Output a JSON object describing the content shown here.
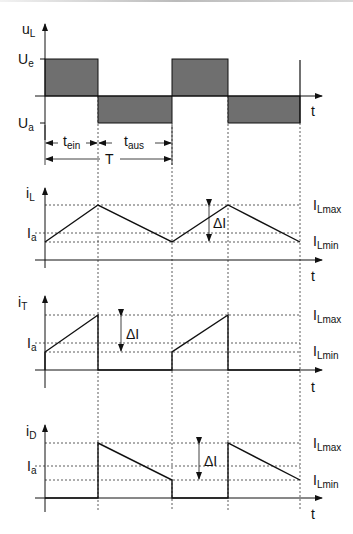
{
  "figure": {
    "colors": {
      "fill_area": "#6f6f6f",
      "line": "#111111",
      "dashed": "#333333",
      "background": "#ffffff"
    }
  },
  "plots": {
    "uL": {
      "axis_label_main": "u",
      "axis_label_sub": "L",
      "level_high_main": "U",
      "level_high_sub": "e",
      "level_low_main": "U",
      "level_low_sub": "a",
      "x_label": "t"
    },
    "timing": {
      "ton_main": "t",
      "ton_sub": "ein",
      "toff_main": "t",
      "toff_sub": "aus",
      "period": "T"
    },
    "iL": {
      "axis_label_main": "i",
      "axis_label_sub": "L",
      "avg_main": "I",
      "avg_sub": "a",
      "max_main": "I",
      "max_sub": "Lmax",
      "min_main": "I",
      "min_sub": "Lmin",
      "delta": "ΔI",
      "x_label": "t"
    },
    "iT": {
      "axis_label_main": "i",
      "axis_label_sub": "T",
      "avg_main": "I",
      "avg_sub": "a",
      "max_main": "I",
      "max_sub": "Lmax",
      "min_main": "I",
      "min_sub": "Lmin",
      "delta": "ΔI",
      "x_label": "t"
    },
    "iD": {
      "axis_label_main": "i",
      "axis_label_sub": "D",
      "avg_main": "I",
      "avg_sub": "a",
      "max_main": "I",
      "max_sub": "Lmax",
      "min_main": "I",
      "min_sub": "Lmin",
      "delta": "ΔI",
      "x_label": "t"
    }
  }
}
